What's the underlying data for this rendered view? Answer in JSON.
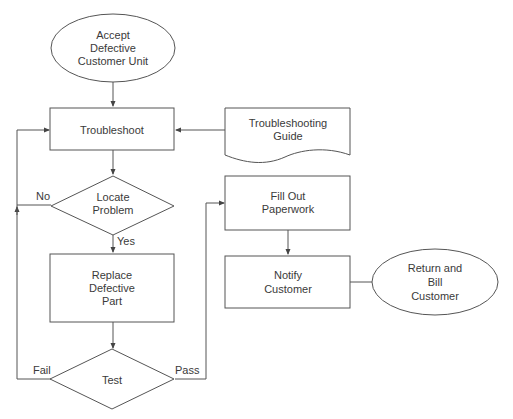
{
  "diagram": {
    "type": "flowchart",
    "nodes": {
      "start": {
        "shape": "oval",
        "lines": [
          "Accept",
          "Defective",
          "Customer Unit"
        ]
      },
      "troubleshoot": {
        "shape": "process",
        "lines": [
          "Troubleshoot"
        ]
      },
      "guide": {
        "shape": "document",
        "lines": [
          "Troubleshooting",
          "Guide"
        ]
      },
      "locate": {
        "shape": "decision",
        "lines": [
          "Locate",
          "Problem"
        ]
      },
      "replace": {
        "shape": "process",
        "lines": [
          "Replace",
          "Defective",
          "Part"
        ]
      },
      "test": {
        "shape": "decision",
        "lines": [
          "Test"
        ]
      },
      "paperwork": {
        "shape": "process",
        "lines": [
          "Fill Out",
          "Paperwork"
        ]
      },
      "notify": {
        "shape": "process",
        "lines": [
          "Notify",
          "Customer"
        ]
      },
      "end": {
        "shape": "oval",
        "lines": [
          "Return and",
          "Bill",
          "Customer"
        ]
      }
    },
    "edges": {
      "no": "No",
      "yes": "Yes",
      "fail": "Fail",
      "pass": "Pass"
    },
    "connections": [
      {
        "from": "start",
        "to": "troubleshoot"
      },
      {
        "from": "guide",
        "to": "troubleshoot"
      },
      {
        "from": "troubleshoot",
        "to": "locate"
      },
      {
        "from": "locate",
        "to": "troubleshoot",
        "label": "No"
      },
      {
        "from": "locate",
        "to": "replace",
        "label": "Yes"
      },
      {
        "from": "replace",
        "to": "test"
      },
      {
        "from": "test",
        "to": "troubleshoot",
        "label": "Fail"
      },
      {
        "from": "test",
        "to": "paperwork",
        "label": "Pass"
      },
      {
        "from": "paperwork",
        "to": "notify"
      },
      {
        "from": "notify",
        "to": "end"
      }
    ],
    "colors": {
      "stroke": "#555555",
      "text": "#3a3a3a",
      "background": "#ffffff"
    }
  }
}
